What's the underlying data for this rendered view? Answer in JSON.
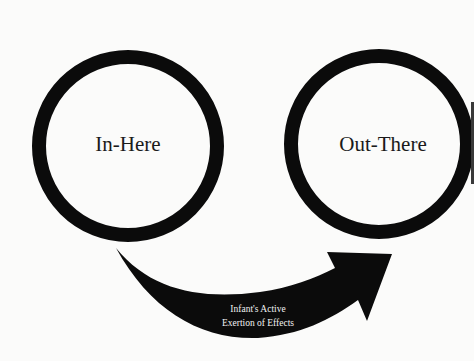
{
  "diagram": {
    "type": "flow",
    "nodes": [
      {
        "id": "in-here",
        "label": "In-Here",
        "shape": "ring",
        "cx": 128,
        "cy": 146,
        "r": 89,
        "stroke": 14
      },
      {
        "id": "out-there",
        "label": "Out-There",
        "shape": "ring",
        "cx": 379,
        "cy": 144,
        "r": 88,
        "stroke": 14
      }
    ],
    "edges": [
      {
        "from": "in-here",
        "to": "out-there",
        "style": "curved-filled-arrow",
        "label_line1": "Infant's Active",
        "label_line2": "Exertion of Effects"
      }
    ]
  },
  "colors": {
    "background": "#fbfbfa",
    "ink": "#0b0b0b",
    "arrow_text": "#f2f2f2"
  }
}
